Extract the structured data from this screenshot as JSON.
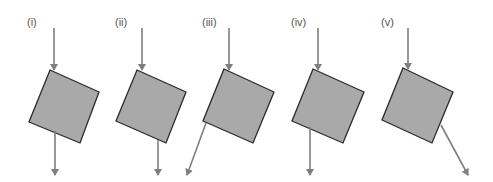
{
  "figure": {
    "colors": {
      "block_fill": "#a9a9a9",
      "block_stroke": "#2b2b2b",
      "arrow": "#7f7f7f",
      "label": "#555555"
    },
    "panels": [
      {
        "label": "(i)",
        "label_pos": [
          27,
          17
        ],
        "block": [
          [
            50,
            70
          ],
          [
            99,
            92
          ],
          [
            80,
            143
          ],
          [
            29,
            122
          ]
        ],
        "arrow_in": {
          "from": [
            54,
            28
          ],
          "to": [
            54,
            70
          ]
        },
        "arrow_out": {
          "from": [
            55,
            131
          ],
          "to": [
            55,
            175
          ]
        }
      },
      {
        "label": "(ii)",
        "label_pos": [
          115,
          17
        ],
        "block": [
          [
            137,
            70
          ],
          [
            186,
            92
          ],
          [
            166,
            143
          ],
          [
            116,
            121
          ]
        ],
        "arrow_in": {
          "from": [
            142,
            28
          ],
          "to": [
            142,
            70
          ]
        },
        "arrow_out": {
          "from": [
            158,
            140
          ],
          "to": [
            158,
            175
          ]
        }
      },
      {
        "label": "(iii)",
        "label_pos": [
          202,
          17
        ],
        "block": [
          [
            224,
            69
          ],
          [
            274,
            92
          ],
          [
            253,
            143
          ],
          [
            203,
            121
          ]
        ],
        "arrow_in": {
          "from": [
            229,
            28
          ],
          "to": [
            229,
            70
          ]
        },
        "arrow_out": {
          "from": [
            206,
            123
          ],
          "to": [
            187,
            175
          ]
        }
      },
      {
        "label": "(iv)",
        "label_pos": [
          291,
          17
        ],
        "block": [
          [
            313,
            69
          ],
          [
            364,
            92
          ],
          [
            343,
            143
          ],
          [
            292,
            121
          ]
        ],
        "arrow_in": {
          "from": [
            318,
            28
          ],
          "to": [
            318,
            70
          ]
        },
        "arrow_out": {
          "from": [
            310,
            127
          ],
          "to": [
            310,
            175
          ]
        }
      },
      {
        "label": "(v)",
        "label_pos": [
          381,
          17
        ],
        "block": [
          [
            403,
            68
          ],
          [
            453,
            92
          ],
          [
            432,
            143
          ],
          [
            382,
            120
          ]
        ],
        "arrow_in": {
          "from": [
            408,
            28
          ],
          "to": [
            408,
            69
          ]
        },
        "arrow_out": {
          "from": [
            441,
            125
          ],
          "to": [
            468,
            175
          ]
        }
      }
    ]
  }
}
